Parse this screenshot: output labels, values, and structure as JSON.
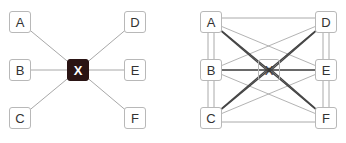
{
  "left_diagram": {
    "hub": "X",
    "nodes": [
      "A",
      "B",
      "C",
      "D",
      "E",
      "F"
    ]
  },
  "right_diagram": {
    "hub": "X",
    "nodes": [
      "A",
      "B",
      "C",
      "D",
      "E",
      "F"
    ]
  },
  "colors": {
    "hub_dark": "#2a1414",
    "line": "#aaaaaa",
    "node_border": "#b8b8b8"
  }
}
